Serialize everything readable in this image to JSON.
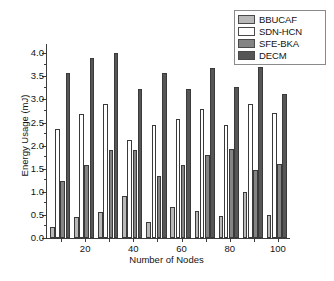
{
  "chart_data": {
    "type": "bar",
    "title": "",
    "xlabel": "Number of Nodes",
    "ylabel": "Energy Usage (mJ)",
    "categories": [
      10,
      20,
      30,
      40,
      50,
      60,
      70,
      80,
      90,
      100
    ],
    "xtick_labels": [
      "20",
      "40",
      "60",
      "80",
      "100"
    ],
    "xtick_values": [
      20,
      40,
      60,
      80,
      100
    ],
    "ytick_labels": [
      "0.0",
      "0.5",
      "1.0",
      "1.5",
      "2.0",
      "2.5",
      "3.0",
      "3.5",
      "4.0"
    ],
    "ytick_values": [
      0.0,
      0.5,
      1.0,
      1.5,
      2.0,
      2.5,
      3.0,
      3.5,
      4.0
    ],
    "ylim": [
      0.0,
      4.2
    ],
    "grid": false,
    "legend_position": "top-right",
    "series": [
      {
        "name": "BBUCAF",
        "color": "#b9b9b9",
        "values": [
          0.23,
          0.46,
          0.57,
          0.9,
          0.34,
          0.68,
          0.59,
          0.48,
          1.0,
          0.49
        ]
      },
      {
        "name": "SDN-HCN",
        "color": "#ffffff",
        "values": [
          2.35,
          2.68,
          2.9,
          2.13,
          2.45,
          2.57,
          2.79,
          2.45,
          2.9,
          2.7
        ]
      },
      {
        "name": "SFE-BKA",
        "color": "#848484",
        "values": [
          1.24,
          1.58,
          1.9,
          1.9,
          1.35,
          1.58,
          1.79,
          1.92,
          1.47,
          1.6
        ]
      },
      {
        "name": "DECM",
        "color": "#565656",
        "values": [
          3.57,
          3.9,
          4.0,
          3.22,
          3.57,
          3.22,
          3.68,
          3.26,
          3.7,
          3.12
        ]
      }
    ]
  }
}
